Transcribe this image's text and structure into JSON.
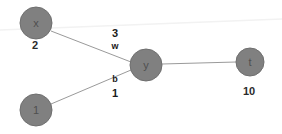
{
  "diagram": {
    "background_color": "#ffffff",
    "node_fill": "#808080",
    "node_stroke": "#6f6f6f",
    "edge_color": "#9a9a9a",
    "faint_edge_color": "#f2f2f2",
    "nodes": [
      {
        "id": "x",
        "label": "x",
        "value": "2",
        "cx": 36,
        "cy": 23,
        "r": 16,
        "value_x": 35,
        "value_y": 45
      },
      {
        "id": "one",
        "label": "1",
        "value": "",
        "cx": 36,
        "cy": 110,
        "r": 16,
        "value_x": 36,
        "value_y": 132
      },
      {
        "id": "y",
        "label": "y",
        "value": "",
        "cx": 146,
        "cy": 65,
        "r": 16,
        "value_x": 146,
        "value_y": 88
      },
      {
        "id": "t",
        "label": "t",
        "value": "10",
        "cx": 250,
        "cy": 62,
        "r": 14,
        "value_x": 249,
        "value_y": 91
      }
    ],
    "edges": [
      {
        "id": "x-y",
        "from": "x",
        "to": "y",
        "name": "w",
        "weight": "3",
        "x1": 51,
        "y1": 31,
        "x2": 131,
        "y2": 62,
        "weight_x": 115,
        "weight_y": 33,
        "name_x": 115,
        "name_y": 46
      },
      {
        "id": "1-y",
        "from": "one",
        "to": "y",
        "name": "b",
        "weight": "1",
        "x1": 51,
        "y1": 104,
        "x2": 131,
        "y2": 70,
        "weight_x": 115,
        "weight_y": 93,
        "name_x": 115,
        "name_y": 79
      },
      {
        "id": "y-t",
        "from": "y",
        "to": "t",
        "name": "",
        "weight": "",
        "x1": 162,
        "y1": 64,
        "x2": 236,
        "y2": 62,
        "weight_x": 0,
        "weight_y": 0,
        "name_x": 0,
        "name_y": 0
      }
    ],
    "faint_edge": {
      "id": "faint-top-line",
      "x1": 0,
      "y1": 30,
      "x2": 282,
      "y2": 19
    }
  }
}
